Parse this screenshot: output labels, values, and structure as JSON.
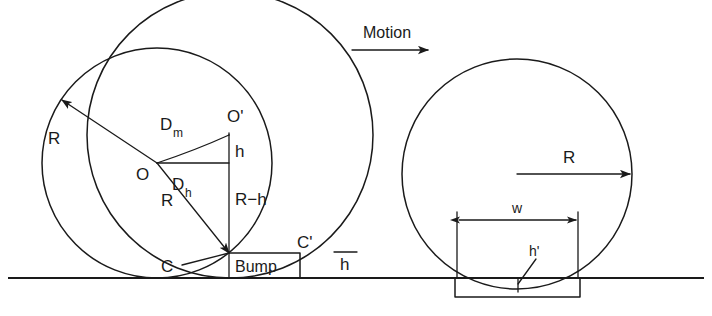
{
  "figure": {
    "stroke_color": "#1a1a1a",
    "background_color": "#ffffff",
    "width": 712,
    "height": 316
  },
  "left_panel": {
    "name": "bump-case",
    "labels": {
      "radius_outer": "R",
      "radius_inner": "R",
      "center_o": "O",
      "center_o_prime": "O'",
      "rise_h": "h",
      "remainder": "R−h",
      "dist_dm_base": "D",
      "dist_dm_sub": "m",
      "dist_dh_base": "D",
      "dist_dh_sub": "h",
      "contact_c": "C",
      "contact_c_prime": "C'",
      "bump_box": "Bump",
      "bump_height": "h"
    },
    "geometry": {
      "circle_o_center_x": 157,
      "circle_o_center_y": 163,
      "circle_o_radius": 115,
      "circle_oprime_center_x": 230,
      "circle_oprime_center_y": 135,
      "circle_oprime_radius": 143,
      "contact_point_x": 229,
      "contact_point_y": 253,
      "ground_y": 278,
      "bump_left_x": 229,
      "bump_right_x": 300,
      "bump_top_y": 253
    }
  },
  "right_panel": {
    "name": "pothole-case",
    "labels": {
      "motion": "Motion",
      "radius": "R",
      "width": "w",
      "depth": "h'"
    },
    "geometry": {
      "circle_center_x": 517,
      "circle_center_y": 174,
      "circle_radius": 115,
      "ground_y": 278,
      "hole_left_x": 455,
      "hole_right_x": 580,
      "hole_bottom_y": 297,
      "motion_arrow_y": 50,
      "motion_arrow_x1": 352,
      "motion_arrow_x2": 430
    }
  }
}
